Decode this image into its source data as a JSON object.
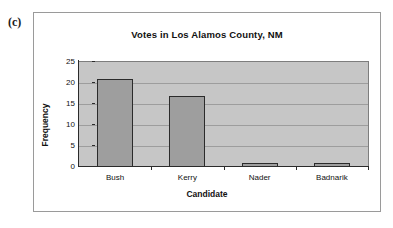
{
  "panel": {
    "label": "(c)"
  },
  "chart_data": {
    "type": "bar",
    "title": "Votes in Los Alamos County, NM",
    "xlabel": "Candidate",
    "ylabel": "Frequency",
    "categories": [
      "Bush",
      "Kerry",
      "Nader",
      "Badnarik"
    ],
    "values": [
      21,
      17,
      1,
      1
    ],
    "ylim": [
      0,
      25
    ],
    "yticks": [
      0,
      5,
      10,
      15,
      20,
      25
    ],
    "ytick_labels": [
      "0",
      "5",
      "10",
      "15",
      "20",
      "25"
    ],
    "grid": "horizontal",
    "legend": "none",
    "colors": {
      "bar_fill": "#9e9e9e",
      "bar_edge": "#2b2b2b",
      "plot_background": "#c6c6c6",
      "gridline": "#9d9d9d",
      "axis": "#2b2b2b",
      "frame": "#9a9a9a",
      "text": "#111111"
    }
  }
}
